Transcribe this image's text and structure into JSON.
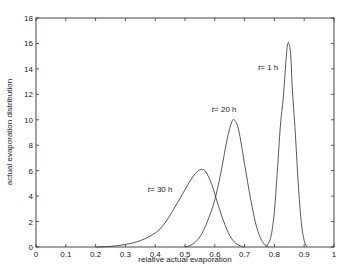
{
  "chart_data": {
    "type": "line",
    "title": "",
    "xlabel": "relative actual evaporation",
    "ylabel": "actual evaporation distribution",
    "xlim": [
      0,
      1
    ],
    "ylim": [
      0,
      18
    ],
    "grid": false,
    "legend": null,
    "x_ticks": [
      0,
      0.1,
      0.2,
      0.3,
      0.4,
      0.5,
      0.6,
      0.7,
      0.8,
      0.9,
      1
    ],
    "x_tick_labels": [
      "0",
      "0.1",
      "0.2",
      "0.3",
      "0.4",
      "0.5",
      "0.6",
      "0.7",
      "0.8",
      "0.9",
      "1"
    ],
    "y_ticks": [
      0,
      2,
      4,
      6,
      8,
      10,
      12,
      14,
      16,
      18
    ],
    "y_tick_labels": [
      "0",
      "2",
      "4",
      "6",
      "8",
      "10",
      "12",
      "14",
      "16",
      "18"
    ],
    "series": [
      {
        "name": "t = 1 h",
        "annotation": {
          "italic": "t",
          "rest": "= 1 h",
          "x": 0.745,
          "y": 13.9
        },
        "x": [
          0.77,
          0.78,
          0.79,
          0.8,
          0.81,
          0.82,
          0.83,
          0.84,
          0.845,
          0.85,
          0.855,
          0.86,
          0.87,
          0.88,
          0.89,
          0.9,
          0.91
        ],
        "y": [
          0.0,
          0.3,
          1.0,
          2.8,
          6.0,
          9.5,
          11.8,
          15.0,
          16.0,
          15.9,
          15.0,
          12.5,
          9.0,
          5.0,
          2.0,
          0.5,
          0.0
        ]
      },
      {
        "name": "t = 20 h",
        "annotation": {
          "italic": "t",
          "rest": "= 20 h",
          "x": 0.59,
          "y": 10.6
        },
        "x": [
          0.5,
          0.52,
          0.54,
          0.56,
          0.58,
          0.6,
          0.62,
          0.64,
          0.655,
          0.665,
          0.68,
          0.7,
          0.72,
          0.74,
          0.76,
          0.78
        ],
        "y": [
          0.0,
          0.15,
          0.5,
          1.2,
          2.3,
          3.7,
          5.8,
          8.3,
          9.7,
          10.0,
          9.2,
          6.5,
          3.8,
          1.6,
          0.4,
          0.0
        ]
      },
      {
        "name": "t = 30 h",
        "annotation": {
          "italic": "t",
          "rest": "= 30 h",
          "x": 0.375,
          "y": 4.3
        },
        "x": [
          0.2,
          0.25,
          0.3,
          0.35,
          0.4,
          0.43,
          0.46,
          0.49,
          0.52,
          0.54,
          0.555,
          0.57,
          0.59,
          0.61,
          0.63,
          0.65,
          0.67,
          0.69,
          0.7
        ],
        "y": [
          0.0,
          0.05,
          0.2,
          0.5,
          1.1,
          1.8,
          2.9,
          4.1,
          5.3,
          5.9,
          6.1,
          5.9,
          4.9,
          3.4,
          2.0,
          0.9,
          0.3,
          0.05,
          0.0
        ]
      }
    ]
  }
}
